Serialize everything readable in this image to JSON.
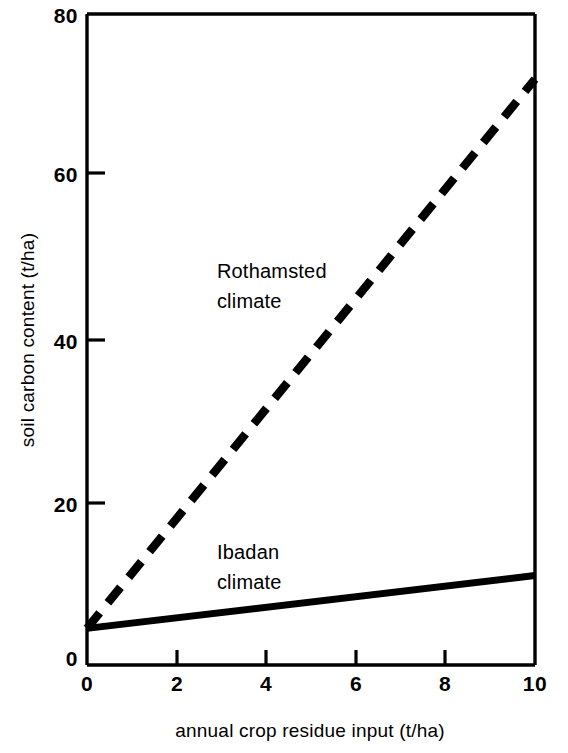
{
  "chart_data": {
    "type": "line",
    "title": "",
    "xlabel": "annual crop residue input (t/ha)",
    "ylabel": "soil carbon content (t/ha)",
    "xlim": [
      0,
      10
    ],
    "ylim": [
      0,
      80
    ],
    "xticks": [
      "0",
      "2",
      "4",
      "6",
      "8",
      "10"
    ],
    "xtick_values": [
      0,
      2,
      4,
      6,
      8,
      10
    ],
    "yticks": [
      "0",
      "20",
      "40",
      "60",
      "80"
    ],
    "ytick_values": [
      0,
      20,
      40,
      60,
      80
    ],
    "grid": false,
    "legend": "inline-annotations",
    "series": [
      {
        "name": "Rothamsted climate",
        "style": "dashed",
        "color": "#000000",
        "x": [
          0,
          10
        ],
        "values": [
          4.5,
          72.0
        ],
        "annotation": {
          "line1": "Rothamsted",
          "line2": "climate",
          "x": 2.9,
          "y": 47.5
        }
      },
      {
        "name": "Ibadan climate",
        "style": "solid",
        "color": "#000000",
        "x": [
          0,
          10
        ],
        "values": [
          4.5,
          11.0
        ],
        "annotation": {
          "line1": "Ibadan",
          "line2": "climate",
          "x": 2.9,
          "y": 13.0
        }
      }
    ]
  },
  "axes": {
    "y_top_label": "80",
    "y_label_60": "60",
    "y_label_40": "40",
    "y_label_20": "20",
    "y_label_0": "0",
    "x_label_0": "0",
    "x_label_2": "2",
    "x_label_4": "4",
    "x_label_6": "6",
    "x_label_8": "8",
    "x_label_10": "10"
  },
  "colors": {
    "background": "#ffffff",
    "ink": "#000000"
  }
}
